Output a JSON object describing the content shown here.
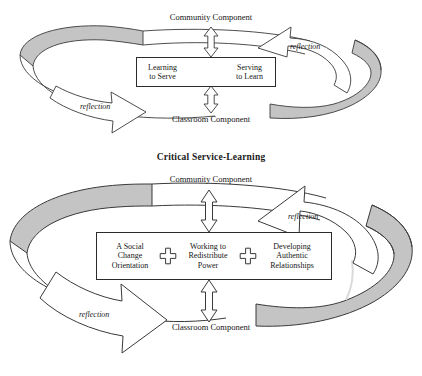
{
  "figures": [
    {
      "id": "traditional-service-learning",
      "title": "Traditional Service-Learning",
      "top_node": "Community Component",
      "bottom_node": "Classroom Component",
      "reflection_left": "reflection",
      "reflection_right": "reflection",
      "core_cells": [
        "Learning\nto Serve",
        "Serving\nto Learn"
      ],
      "core_connector": "horizontal-double-arrow"
    },
    {
      "id": "critical-service-learning",
      "title": "Critical Service-Learning",
      "top_node": "Community Component",
      "bottom_node": "Classroom Component",
      "reflection_left": "reflection",
      "reflection_right": "reflection",
      "core_cells": [
        "A Social\nChange\nOrientation",
        "Working to\nRedistribute\nPower",
        "Developing\nAuthentic\nRelationships"
      ],
      "core_connector": "plus-sign"
    }
  ],
  "colors": {
    "ribbon_fill": "#c4c4c4",
    "ribbon_stroke": "#3a3a3a",
    "arrow_fill": "#ffffff",
    "arrow_stroke": "#3a3a3a",
    "text": "#161616",
    "page_background": "#ffffff"
  },
  "icons": {
    "ribbon": "circular-ribbon-loop-icon",
    "reflection_arrow": "curved-block-arrow-icon",
    "vertical_arrow": "vertical-double-arrow-icon",
    "horizontal_arrow": "horizontal-double-arrow-icon",
    "plus": "plus-sign-icon"
  }
}
